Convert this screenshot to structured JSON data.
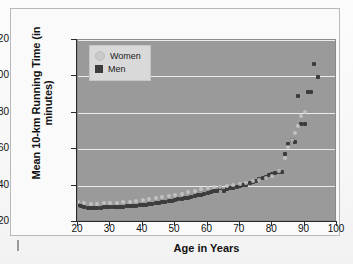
{
  "figure": {
    "ylabel": "Mean 10-km Running Time (in minutes)",
    "xlabel": "Age in Years"
  },
  "legend": {
    "items": [
      {
        "label": "Women",
        "marker": "circle-marker",
        "color": "#c9c9c9"
      },
      {
        "label": "Men",
        "marker": "square-marker",
        "color": "#3c3c3c"
      }
    ]
  },
  "chart_data": {
    "type": "scatter",
    "title": "",
    "xlabel": "Age in Years",
    "ylabel": "Mean 10-km Running Time (in minutes)",
    "xlim": [
      20,
      100
    ],
    "ylim": [
      20,
      120
    ],
    "xticks": [
      20,
      30,
      40,
      50,
      60,
      70,
      80,
      90,
      100
    ],
    "yticks": [
      20,
      40,
      60,
      80,
      100,
      120
    ],
    "grid": "horizontal",
    "legend_position": "upper-left-inside",
    "plot_background": "#9a9a9a",
    "gridline_color": "#f0f0f0",
    "series": [
      {
        "name": "Men",
        "marker": "square",
        "color": "#3c3c3c",
        "x": [
          20,
          21,
          22,
          23,
          24,
          25,
          26,
          27,
          28,
          29,
          30,
          31,
          32,
          33,
          34,
          35,
          36,
          37,
          38,
          39,
          40,
          41,
          42,
          43,
          44,
          45,
          46,
          47,
          48,
          49,
          50,
          51,
          52,
          53,
          54,
          55,
          56,
          57,
          58,
          59,
          60,
          61,
          62,
          63,
          64,
          65,
          66,
          67,
          68,
          69,
          70,
          71,
          72,
          73,
          74,
          75,
          76,
          77,
          78,
          79,
          80,
          81,
          82,
          83,
          84,
          85,
          86,
          87,
          88,
          89,
          90,
          91,
          92,
          93,
          94
        ],
        "y": [
          29.2,
          28.6,
          28.1,
          27.9,
          27.8,
          27.8,
          27.9,
          27.9,
          28.0,
          28.1,
          28.2,
          28.2,
          28.3,
          28.4,
          28.5,
          28.6,
          28.7,
          28.9,
          29.0,
          29.2,
          29.4,
          29.6,
          29.8,
          30.0,
          30.2,
          30.6,
          30.9,
          31.2,
          31.5,
          31.8,
          32.1,
          32.4,
          32.7,
          33.0,
          33.4,
          33.8,
          34.2,
          34.6,
          35.0,
          35.4,
          36.0,
          36.5,
          36.9,
          37.1,
          38.6,
          37.3,
          38.2,
          38.5,
          38.8,
          39.2,
          39.6,
          40.1,
          40.6,
          41.2,
          41.9,
          42.6,
          43.4,
          44.2,
          45.0,
          45.8,
          46.6,
          47.0,
          47.3,
          47.4,
          57.5,
          62.8,
          64.8,
          64.2,
          89.5,
          74.0,
          73.8,
          91.6,
          91.4,
          106.8,
          99.6
        ]
      },
      {
        "name": "Women",
        "marker": "circle",
        "color": "#c9c9c9",
        "x": [
          20,
          22,
          24,
          26,
          28,
          30,
          32,
          34,
          36,
          38,
          40,
          42,
          44,
          46,
          48,
          50,
          52,
          54,
          56,
          58,
          60,
          62,
          64,
          66,
          68,
          70,
          72,
          74,
          76,
          78,
          80,
          82,
          84,
          85,
          86,
          87,
          88,
          89,
          90
        ],
        "y": [
          30.8,
          30.2,
          30.0,
          30.0,
          30.2,
          30.4,
          30.6,
          30.9,
          31.2,
          31.6,
          32.0,
          32.5,
          33.0,
          33.6,
          34.2,
          34.9,
          35.6,
          36.4,
          37.2,
          38.0,
          38.6,
          39.0,
          39.4,
          39.8,
          40.2,
          40.8,
          41.5,
          42.3,
          43.2,
          44.2,
          45.4,
          48.0,
          55.0,
          61.0,
          65.0,
          69.0,
          73.0,
          78.0,
          80.5
        ]
      }
    ]
  }
}
